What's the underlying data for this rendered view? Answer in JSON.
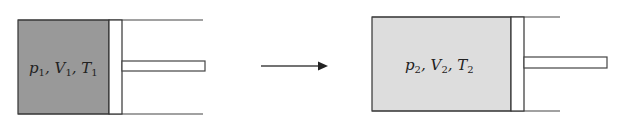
{
  "diagram": {
    "type": "piston-cylinder state change",
    "state1": {
      "label_parts": [
        {
          "sym": "p",
          "sub": "1"
        },
        {
          "sym": "V",
          "sub": "1"
        },
        {
          "sym": "T",
          "sub": "1"
        }
      ],
      "gas_color": "#999999"
    },
    "state2": {
      "label_parts": [
        {
          "sym": "p",
          "sub": "2"
        },
        {
          "sym": "V",
          "sub": "2"
        },
        {
          "sym": "T",
          "sub": "2"
        }
      ],
      "gas_color": "#dddddd"
    },
    "arrow": "process-arrow",
    "separator": ", "
  }
}
